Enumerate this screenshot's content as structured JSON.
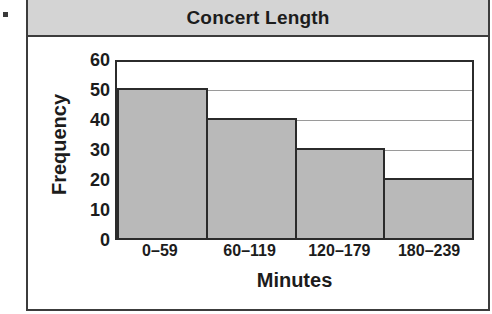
{
  "bullet": {
    "name": "list-bullet"
  },
  "card": {
    "title": "Concert Length"
  },
  "chart_data": {
    "type": "bar",
    "title": "Concert Length",
    "xlabel": "Minutes",
    "ylabel": "Frequency",
    "categories": [
      "0–59",
      "60–119",
      "120–179",
      "180–239"
    ],
    "values": [
      50,
      40,
      30,
      20
    ],
    "yticks": [
      60,
      50,
      40,
      30,
      20,
      10,
      0
    ],
    "ylim": [
      0,
      60
    ],
    "grid": true,
    "legend": false,
    "colors": {
      "bar_fill": "#b9b9b9",
      "bar_edge": "#2b2b2b",
      "header_band": "#d4d4d4",
      "frame": "#3c3c3c",
      "gridline": "#9a9a9a",
      "text": "#1c1c1c"
    }
  }
}
